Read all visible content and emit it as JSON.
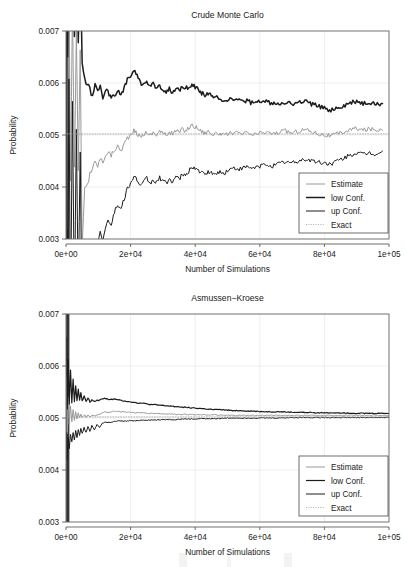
{
  "figure": {
    "background": "#ffffff",
    "panels": [
      "crude-monte-carlo",
      "asmussen-kroese"
    ]
  },
  "chart_data": [
    {
      "type": "line",
      "title": "Crude Monte Carlo",
      "xlabel": "Number of Simulations",
      "ylabel": "Probability",
      "xlim": [
        0,
        100000
      ],
      "ylim": [
        0.003,
        0.007
      ],
      "xticks": [
        0,
        20000,
        40000,
        60000,
        80000,
        100000
      ],
      "xticklabels": [
        "0e+00",
        "2e+04",
        "4e+04",
        "6e+04",
        "8e+04",
        "1e+05"
      ],
      "yticks": [
        0.003,
        0.004,
        0.005,
        0.006,
        0.007
      ],
      "yticklabels": [
        "0.003",
        "0.004",
        "0.005",
        "0.006",
        "0.007"
      ],
      "grid": true,
      "legend_position": "bottom-right",
      "legend": [
        {
          "label": "Estimate",
          "color": "#9a9a9a",
          "width": 1.0,
          "dash": "none"
        },
        {
          "label": "low Conf.",
          "color": "#1c1c1c",
          "width": 1.5,
          "dash": "none"
        },
        {
          "label": "up Conf.",
          "color": "#1c1c1c",
          "width": 1.0,
          "dash": "none"
        },
        {
          "label": "Exact",
          "color": "#9a9a9a",
          "width": 0.8,
          "dash": "dotted"
        }
      ],
      "x": [
        200,
        500,
        900,
        1400,
        2000,
        2600,
        3200,
        3800,
        4400,
        5000,
        5800,
        6600,
        7400,
        8200,
        9000,
        9800,
        10600,
        11400,
        12200,
        13000,
        14000,
        15000,
        16000,
        17000,
        18000,
        19000,
        20000,
        21000,
        22000,
        23000,
        24000,
        25000,
        26000,
        27000,
        28000,
        29000,
        30000,
        31000,
        32000,
        33000,
        34000,
        35000,
        36000,
        37000,
        38000,
        39000,
        40000,
        41000,
        42000,
        43000,
        44000,
        45000,
        46000,
        47000,
        48000,
        49000,
        50000,
        52000,
        54000,
        56000,
        58000,
        60000,
        62000,
        64000,
        66000,
        68000,
        70000,
        72000,
        74000,
        76000,
        78000,
        80000,
        82000,
        84000,
        86000,
        88000,
        90000,
        92000,
        94000,
        96000,
        98000,
        100000
      ],
      "series": [
        {
          "name": "Estimate",
          "color": "#9a9a9a",
          "width": 1.0,
          "values": [
            0.00905,
            0.00315,
            0.0082,
            0.00405,
            0.0076,
            0.00425,
            0.007,
            0.00435,
            0.0066,
            0.0028,
            0.00398,
            0.00404,
            0.0043,
            0.00437,
            0.00448,
            0.00441,
            0.00455,
            0.00448,
            0.00462,
            0.00468,
            0.00461,
            0.00472,
            0.00478,
            0.0047,
            0.00483,
            0.00495,
            0.00498,
            0.00508,
            0.00503,
            0.00496,
            0.00501,
            0.00507,
            0.00499,
            0.00505,
            0.00501,
            0.00508,
            0.00503,
            0.005,
            0.00506,
            0.00502,
            0.00509,
            0.00505,
            0.00511,
            0.00508,
            0.00514,
            0.00519,
            0.00516,
            0.00512,
            0.00507,
            0.00504,
            0.00508,
            0.00503,
            0.005,
            0.00505,
            0.00501,
            0.00498,
            0.00502,
            0.00505,
            0.00501,
            0.00504,
            0.005,
            0.00503,
            0.00506,
            0.00502,
            0.00505,
            0.00508,
            0.00504,
            0.00508,
            0.00511,
            0.00507,
            0.00503,
            0.005,
            0.00498,
            0.00502,
            0.00506,
            0.0051,
            0.00513,
            0.00509,
            0.00512,
            0.00509,
            0.00513
          ]
        },
        {
          "name": "low Conf.",
          "color": "#1c1c1c",
          "width": 1.5,
          "values": [
            0.011,
            0.0066,
            0.0102,
            0.0074,
            0.0096,
            0.007,
            0.0089,
            0.0068,
            0.0085,
            0.0064,
            0.00605,
            0.00598,
            0.00592,
            0.00575,
            0.00601,
            0.00585,
            0.00596,
            0.00572,
            0.00588,
            0.00582,
            0.00575,
            0.00578,
            0.00584,
            0.00576,
            0.00589,
            0.00608,
            0.00612,
            0.00622,
            0.00616,
            0.00601,
            0.00598,
            0.00604,
            0.00593,
            0.00597,
            0.0059,
            0.00594,
            0.00589,
            0.00584,
            0.00588,
            0.00583,
            0.0059,
            0.00585,
            0.00591,
            0.00588,
            0.00594,
            0.00598,
            0.00592,
            0.00587,
            0.00581,
            0.00577,
            0.0058,
            0.00574,
            0.0057,
            0.00574,
            0.00569,
            0.00565,
            0.00568,
            0.0057,
            0.00564,
            0.00566,
            0.00561,
            0.00563,
            0.00565,
            0.0056,
            0.00562,
            0.00564,
            0.00559,
            0.00562,
            0.00565,
            0.0056,
            0.00555,
            0.00551,
            0.00548,
            0.00552,
            0.00556,
            0.00561,
            0.00565,
            0.0056,
            0.00563,
            0.00559,
            0.00562
          ]
        },
        {
          "name": "up Conf.",
          "color": "#1c1c1c",
          "width": 1.0,
          "values": [
            0.0071,
            0.001,
            0.0062,
            0.0015,
            0.0056,
            0.0017,
            0.0051,
            0.0019,
            0.0047,
            0.0012,
            0.0019,
            0.0021,
            0.00268,
            0.00282,
            0.00295,
            0.00288,
            0.00314,
            0.003,
            0.00324,
            0.00336,
            0.0033,
            0.00352,
            0.00366,
            0.00356,
            0.00377,
            0.00398,
            0.00404,
            0.00422,
            0.00414,
            0.004,
            0.00408,
            0.00418,
            0.00406,
            0.00414,
            0.00408,
            0.00418,
            0.00412,
            0.00407,
            0.00416,
            0.0041,
            0.0042,
            0.00414,
            0.00424,
            0.0042,
            0.0043,
            0.0044,
            0.00436,
            0.00432,
            0.00426,
            0.00424,
            0.0043,
            0.00426,
            0.00423,
            0.0043,
            0.00427,
            0.00426,
            0.00432,
            0.00436,
            0.00434,
            0.00438,
            0.00436,
            0.0044,
            0.00444,
            0.00441,
            0.00445,
            0.00449,
            0.00446,
            0.0045,
            0.00454,
            0.00451,
            0.00448,
            0.00446,
            0.00445,
            0.0045,
            0.00455,
            0.00461,
            0.00466,
            0.00462,
            0.00466,
            0.00463,
            0.00468
          ]
        },
        {
          "name": "Exact",
          "color": "#9a9a9a",
          "width": 0.8,
          "dash": "dotted",
          "constant": 0.00502
        }
      ]
    },
    {
      "type": "line",
      "title": "Asmussen−Kroese",
      "xlabel": "Number of Simulations",
      "ylabel": "Probability",
      "xlim": [
        0,
        100000
      ],
      "ylim": [
        0.003,
        0.007
      ],
      "xticks": [
        0,
        20000,
        40000,
        60000,
        80000,
        100000
      ],
      "xticklabels": [
        "0e+00",
        "2e+04",
        "4e+04",
        "6e+04",
        "8e+04",
        "1e+05"
      ],
      "yticks": [
        0.003,
        0.004,
        0.005,
        0.006,
        0.007
      ],
      "yticklabels": [
        "0.003",
        "0.004",
        "0.005",
        "0.006",
        "0.007"
      ],
      "grid": true,
      "legend_position": "bottom-right",
      "legend": [
        {
          "label": "Estimate",
          "color": "#9a9a9a",
          "width": 1.0,
          "dash": "none"
        },
        {
          "label": "low Conf.",
          "color": "#1c1c1c",
          "width": 1.2,
          "dash": "none"
        },
        {
          "label": "up Conf.",
          "color": "#1c1c1c",
          "width": 1.0,
          "dash": "none"
        },
        {
          "label": "Exact",
          "color": "#9a9a9a",
          "width": 0.8,
          "dash": "dotted"
        }
      ],
      "x": [
        200,
        400,
        700,
        1000,
        1400,
        1800,
        2200,
        2600,
        3000,
        3400,
        3800,
        4200,
        4600,
        5000,
        5600,
        6200,
        6800,
        7400,
        8000,
        8800,
        9600,
        10400,
        11200,
        12000,
        13000,
        14000,
        15000,
        16000,
        17000,
        18000,
        19000,
        20000,
        22000,
        24000,
        26000,
        28000,
        30000,
        32000,
        34000,
        36000,
        38000,
        40000,
        42000,
        44000,
        46000,
        48000,
        50000,
        54000,
        58000,
        62000,
        66000,
        70000,
        74000,
        78000,
        82000,
        86000,
        90000,
        94000,
        98000,
        100000
      ],
      "series": [
        {
          "name": "Estimate",
          "color": "#9a9a9a",
          "width": 1.0,
          "values": [
            0.00575,
            0.0047,
            0.0054,
            0.00486,
            0.00524,
            0.00492,
            0.00516,
            0.00496,
            0.00512,
            0.00498,
            0.0051,
            0.005,
            0.00508,
            0.00501,
            0.00506,
            0.00502,
            0.00505,
            0.00503,
            0.00505,
            0.00504,
            0.00506,
            0.00507,
            0.0051,
            0.00512,
            0.00511,
            0.00512,
            0.00513,
            0.00513,
            0.00512,
            0.00512,
            0.00511,
            0.00511,
            0.0051,
            0.0051,
            0.00509,
            0.00509,
            0.00508,
            0.00508,
            0.00507,
            0.00507,
            0.00507,
            0.00506,
            0.00506,
            0.00506,
            0.00506,
            0.00505,
            0.00505,
            0.00505,
            0.00505,
            0.00505,
            0.00505,
            0.00505,
            0.00505,
            0.00505,
            0.00505,
            0.00505,
            0.00505,
            0.00505,
            0.00505,
            0.00505
          ]
        },
        {
          "name": "low Conf.",
          "color": "#1c1c1c",
          "width": 1.2,
          "values": [
            0.00655,
            0.0052,
            0.00612,
            0.00528,
            0.0059,
            0.0053,
            0.00574,
            0.00532,
            0.00562,
            0.00534,
            0.00556,
            0.00534,
            0.00548,
            0.00533,
            0.00542,
            0.00532,
            0.00538,
            0.00531,
            0.00536,
            0.00532,
            0.00534,
            0.00534,
            0.00537,
            0.00538,
            0.00536,
            0.00536,
            0.00536,
            0.00535,
            0.00534,
            0.00533,
            0.00532,
            0.00531,
            0.00529,
            0.00528,
            0.00526,
            0.00525,
            0.00524,
            0.00523,
            0.00522,
            0.00521,
            0.0052,
            0.00519,
            0.00518,
            0.00517,
            0.00516,
            0.00516,
            0.00515,
            0.00514,
            0.00513,
            0.00512,
            0.00512,
            0.00511,
            0.00511,
            0.0051,
            0.0051,
            0.0051,
            0.00509,
            0.00509,
            0.00509,
            0.00509
          ]
        },
        {
          "name": "up Conf.",
          "color": "#1c1c1c",
          "width": 1.0,
          "values": [
            0.0047,
            0.0042,
            0.00462,
            0.0044,
            0.00468,
            0.00452,
            0.00472,
            0.00458,
            0.00476,
            0.00462,
            0.00478,
            0.00466,
            0.0048,
            0.0047,
            0.00482,
            0.00472,
            0.00484,
            0.00475,
            0.00486,
            0.00478,
            0.00488,
            0.00481,
            0.0049,
            0.00492,
            0.00491,
            0.00492,
            0.00493,
            0.00494,
            0.00494,
            0.00494,
            0.00494,
            0.00495,
            0.00495,
            0.00496,
            0.00496,
            0.00496,
            0.00497,
            0.00497,
            0.00497,
            0.00498,
            0.00498,
            0.00498,
            0.00499,
            0.00499,
            0.00499,
            0.00499,
            0.005,
            0.005,
            0.005,
            0.005,
            0.005,
            0.00501,
            0.00501,
            0.00501,
            0.00501,
            0.00501,
            0.00501,
            0.00501,
            0.00501,
            0.00501
          ]
        },
        {
          "name": "Exact",
          "color": "#9a9a9a",
          "width": 0.8,
          "dash": "dotted",
          "constant": 0.00502
        }
      ]
    }
  ]
}
